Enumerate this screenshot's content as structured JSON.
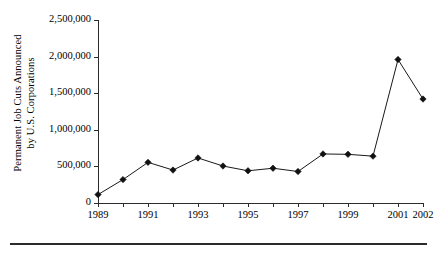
{
  "chart_data": {
    "type": "line",
    "title": "",
    "subtitle": "",
    "xlabel": "",
    "ylabel": "Permanent Job Cuts Announced by U.S. Corporations",
    "ylabel_line1": "Permanent Job Cuts Announced",
    "ylabel_line2": "by U.S. Corporations",
    "x": [
      1989,
      1990,
      1991,
      1992,
      1993,
      1994,
      1995,
      1996,
      1997,
      1998,
      1999,
      2000,
      2001,
      2002
    ],
    "values": [
      115000,
      320000,
      555000,
      450000,
      615000,
      505000,
      440000,
      475000,
      430000,
      670000,
      665000,
      640000,
      1960000,
      1420000
    ],
    "series": [
      {
        "name": "Permanent Job Cuts Announced by U.S. Corporations",
        "values": [
          115000,
          320000,
          555000,
          450000,
          615000,
          505000,
          440000,
          475000,
          430000,
          670000,
          665000,
          640000,
          1960000,
          1420000
        ]
      }
    ],
    "ylim": [
      0,
      2500000
    ],
    "xlim": [
      1989,
      2002
    ],
    "ytick_values": [
      0,
      500000,
      1000000,
      1500000,
      2000000,
      2500000
    ],
    "ytick_labels": [
      "0",
      "500,000",
      "1,000,000",
      "1,500,000",
      "2,000,000",
      "2,500,000"
    ],
    "xtick_values": [
      1989,
      1990,
      1991,
      1992,
      1993,
      1994,
      1995,
      1996,
      1997,
      1998,
      1999,
      2000,
      2001,
      2002
    ],
    "xtick_labels": [
      "1989",
      "",
      "1991",
      "",
      "1993",
      "",
      "1995",
      "",
      "1997",
      "",
      "1999",
      "",
      "2001",
      "2002"
    ],
    "grid": false,
    "legend": false,
    "legend_position": "none",
    "marker": "diamond",
    "line_color": "#1a1a1a",
    "marker_color": "#111111",
    "annotations": []
  }
}
